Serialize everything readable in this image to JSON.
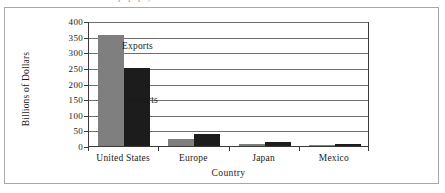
{
  "figure": {
    "clipped_caption_remnant": "p      p    p   ,"
  },
  "chart_data": {
    "type": "bar",
    "title": "",
    "xlabel": "Country",
    "ylabel": "Billions of Dollars",
    "categories": [
      "United States",
      "Europe",
      "Japan",
      "Mexico"
    ],
    "series": [
      {
        "name": "Exports",
        "color": "#7f7f7f",
        "values": [
          355,
          23,
          8,
          4
        ]
      },
      {
        "name": "Imports",
        "color": "#1c1c1c",
        "values": [
          250,
          40,
          13,
          7
        ]
      }
    ],
    "ylim": [
      0,
      400
    ],
    "yticks": [
      0,
      50,
      100,
      150,
      200,
      250,
      300,
      350,
      400
    ],
    "ytick_labels": [
      "0",
      "50",
      "100",
      "150",
      "200",
      "250",
      "300",
      "350",
      "400"
    ],
    "grid": true,
    "legend_position": "inline-annotations",
    "annotations": [
      {
        "text": "Exports",
        "series": "Exports",
        "value_anchor": 340
      },
      {
        "text": "Imports",
        "series": "Imports",
        "value_anchor": 165
      }
    ]
  }
}
